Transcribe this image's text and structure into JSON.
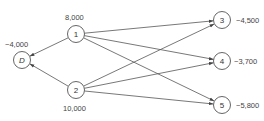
{
  "diagram": {
    "type": "directed-network",
    "nodes": [
      {
        "id": "D",
        "label": "D",
        "italic": true,
        "value": "−4,000",
        "cx": 22,
        "cy": 60
      },
      {
        "id": "1",
        "label": "1",
        "italic": false,
        "value": "8,000",
        "cx": 76,
        "cy": 34
      },
      {
        "id": "2",
        "label": "2",
        "italic": false,
        "value": "10,000",
        "cx": 76,
        "cy": 90
      },
      {
        "id": "3",
        "label": "3",
        "italic": false,
        "value": "−4,500",
        "cx": 222,
        "cy": 20
      },
      {
        "id": "4",
        "label": "4",
        "italic": false,
        "value": "−3,700",
        "cx": 222,
        "cy": 61
      },
      {
        "id": "5",
        "label": "5",
        "italic": false,
        "value": "−5,800",
        "cx": 222,
        "cy": 105
      }
    ],
    "edges": [
      {
        "from": "1",
        "to": "D"
      },
      {
        "from": "2",
        "to": "D"
      },
      {
        "from": "1",
        "to": "3"
      },
      {
        "from": "1",
        "to": "4"
      },
      {
        "from": "1",
        "to": "5"
      },
      {
        "from": "2",
        "to": "3"
      },
      {
        "from": "2",
        "to": "4"
      },
      {
        "from": "2",
        "to": "5"
      }
    ]
  },
  "labels": {
    "node_D": "D",
    "node_1": "1",
    "node_2": "2",
    "node_3": "3",
    "node_4": "4",
    "node_5": "5",
    "value_D": "−4,000",
    "value_1": "8,000",
    "value_2": "10,000",
    "value_3": "−4,500",
    "value_4": "−3,700",
    "value_5": "−5,800"
  }
}
